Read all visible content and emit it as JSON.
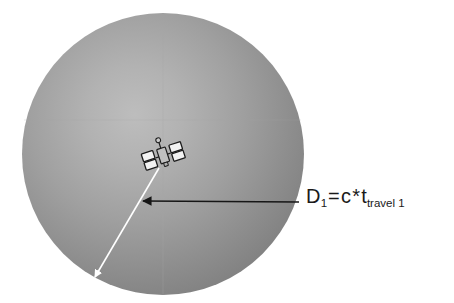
{
  "scene": {
    "title": "Satellite signal travel distance diagram",
    "background_color": "#ffffff"
  },
  "planet": {
    "name": "planet-sphere",
    "shape": "circle",
    "center_x": 163,
    "center_y": 154,
    "radius": 141,
    "fill_center_color": "#b0b0b0",
    "fill_edge_color": "#767676",
    "highlight_x": 120,
    "highlight_y": 120
  },
  "satellite": {
    "name": "satellite-icon",
    "x": 163,
    "y": 155,
    "body_color": "#b9b9b9",
    "panel_color": "#f2f2f2",
    "outline_color": "#1c1c1c",
    "rotation_deg": -18
  },
  "radius_arrow": {
    "name": "radius-arrow",
    "color": "#ffffff",
    "from_x": 159,
    "from_y": 168,
    "to_x": 95,
    "to_y": 277,
    "stroke_width": 1.6
  },
  "annotation_arrow": {
    "name": "distance-annotation-arrow",
    "color": "#161616",
    "from_x": 299,
    "from_y": 202,
    "to_x": 143,
    "to_y": 201,
    "stroke_width": 1.7
  },
  "annotation": {
    "name": "distance-formula",
    "full_text": "D1 = c * ttravel 1",
    "variable": "D",
    "variable_subscript": "1",
    "equals": "=",
    "speed_symbol": "c",
    "operator": "*",
    "time_symbol": "t",
    "time_subscript": "travel 1",
    "text_color": "#1a1a1a"
  }
}
